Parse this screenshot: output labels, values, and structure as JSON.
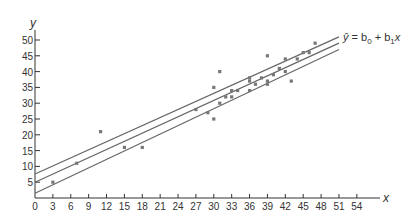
{
  "chart_data": {
    "type": "scatter",
    "title": "",
    "xlabel": "x",
    "ylabel": "y",
    "xlim": [
      0,
      56
    ],
    "ylim": [
      0,
      52
    ],
    "x_ticks": [
      0,
      3,
      6,
      9,
      12,
      15,
      18,
      21,
      24,
      27,
      30,
      33,
      36,
      39,
      42,
      45,
      48,
      51,
      54
    ],
    "y_ticks": [
      5,
      10,
      15,
      20,
      25,
      30,
      35,
      40,
      45,
      50
    ],
    "grid": false,
    "points": [
      [
        3,
        5
      ],
      [
        7,
        11
      ],
      [
        11,
        21
      ],
      [
        15,
        16
      ],
      [
        18,
        16
      ],
      [
        27,
        28
      ],
      [
        29,
        27
      ],
      [
        30,
        25
      ],
      [
        30,
        35
      ],
      [
        31,
        30
      ],
      [
        31,
        40
      ],
      [
        32,
        32
      ],
      [
        33,
        34
      ],
      [
        33,
        32
      ],
      [
        34,
        34
      ],
      [
        36,
        38
      ],
      [
        36,
        37
      ],
      [
        36,
        34
      ],
      [
        37,
        36
      ],
      [
        38,
        38
      ],
      [
        39,
        45
      ],
      [
        39,
        37
      ],
      [
        39,
        36
      ],
      [
        40,
        39
      ],
      [
        41,
        41
      ],
      [
        42,
        44
      ],
      [
        42,
        40
      ],
      [
        43,
        37
      ],
      [
        44,
        44
      ],
      [
        45,
        46
      ],
      [
        46,
        46
      ],
      [
        47,
        49
      ]
    ],
    "regression_line": {
      "label": "ŷ = b0 + b1x",
      "x": [
        0,
        51
      ],
      "y": [
        5,
        49
      ]
    },
    "confidence_band_upper": {
      "x": [
        0,
        51
      ],
      "y": [
        7.6,
        51
      ]
    },
    "confidence_band_lower": {
      "x": [
        0,
        51
      ],
      "y": [
        1.5,
        47
      ]
    },
    "annotation": "ŷ = b₀ + b₁x",
    "colors": {
      "axis": "#333333",
      "lines": "#666666",
      "points": "#777777"
    }
  },
  "labels": {
    "y_axis": "y",
    "x_axis": "x",
    "equation_yhat": "ŷ",
    "equation_rest": " = b",
    "eq_sub0": "0",
    "eq_plus": " + b",
    "eq_sub1": "1",
    "eq_x": "x"
  }
}
